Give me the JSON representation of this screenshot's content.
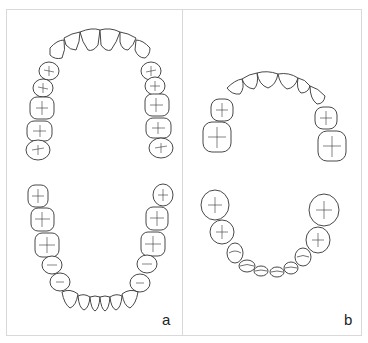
{
  "figure": {
    "panels": [
      {
        "label": "a",
        "description": "Maxillary and mandibular dental arches, occlusal view"
      },
      {
        "label": "b",
        "description": "Primary dentition upper and lower arches, occlusal view"
      }
    ]
  },
  "colors": {
    "line": "#333333",
    "border": "#d9d9d9",
    "background": "#ffffff"
  }
}
